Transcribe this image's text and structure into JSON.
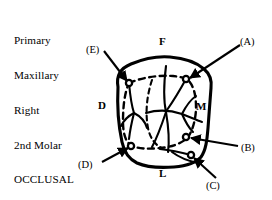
{
  "figure": {
    "title_lines": [
      "Primary",
      "Maxillary",
      "Right",
      "2nd Molar",
      "OCCLUSAL"
    ],
    "title_text": "Primary Maxillary Right 2nd Molar OCCLUSAL",
    "view": "OCCLUSAL",
    "tooth": "Primary Maxillary Right 2nd Molar",
    "ink_color": "#000000",
    "background_color": "#ffffff"
  },
  "orientation_labels": [
    {
      "key": "facial",
      "label": "F",
      "meaning": "Facial",
      "position": "top"
    },
    {
      "key": "distal",
      "label": "D",
      "meaning": "Distal",
      "position": "left"
    },
    {
      "key": "mesial",
      "label": "M",
      "meaning": "Mesial",
      "position": "right"
    },
    {
      "key": "lingual",
      "label": "L",
      "meaning": "Lingual",
      "position": "bottom"
    }
  ],
  "callouts": [
    {
      "key": "A",
      "label": "(A)",
      "target": "mesiofacial cusp tip",
      "arrow_from": "upper-right",
      "arrow_to": "inner-upper-right"
    },
    {
      "key": "B",
      "label": "(B)",
      "target": "mesiolingual cusp tip",
      "arrow_from": "right",
      "arrow_to": "inner-lower-right"
    },
    {
      "key": "C",
      "label": "(C)",
      "target": "tubercle of Carabelli",
      "arrow_from": "lower-right",
      "arrow_to": "outer-lower-right"
    },
    {
      "key": "D",
      "label": "(D)",
      "target": "distolingual cusp tip",
      "arrow_from": "lower-left",
      "arrow_to": "inner-lower-left"
    },
    {
      "key": "E",
      "label": "(E)",
      "target": "distofacial cusp tip",
      "arrow_from": "upper-left",
      "arrow_to": "inner-upper-left"
    }
  ],
  "markers": [
    {
      "key": "E",
      "cx": 129,
      "cy": 83
    },
    {
      "key": "A",
      "cx": 186,
      "cy": 79
    },
    {
      "key": "D",
      "cx": 131,
      "cy": 146
    },
    {
      "key": "B",
      "cx": 186,
      "cy": 137
    },
    {
      "key": "C",
      "cx": 191,
      "cy": 155
    }
  ]
}
